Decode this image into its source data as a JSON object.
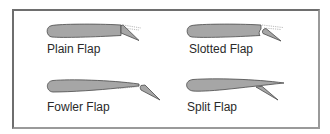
{
  "diagram": {
    "panels": [
      {
        "id": "plain",
        "label": "Plain Flap"
      },
      {
        "id": "slotted",
        "label": "Slotted Flap"
      },
      {
        "id": "fowler",
        "label": "Fowler Flap"
      },
      {
        "id": "split",
        "label": "Split Flap"
      }
    ],
    "colors": {
      "airfoil_fill": "#a6a6a6",
      "airfoil_stroke": "#4a4a4a",
      "dotted_outline": "#8a8a8a",
      "frame_border": "#7a7a7a",
      "label_text": "#2a2a2a"
    }
  }
}
